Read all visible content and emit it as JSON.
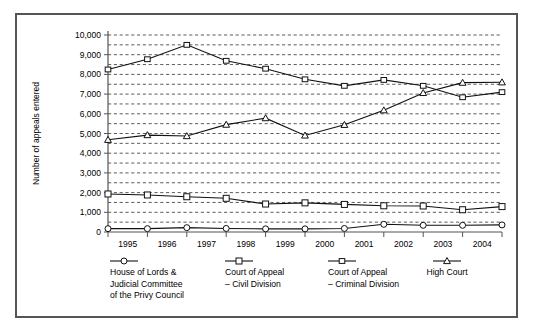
{
  "chart_data": {
    "type": "line",
    "title": "",
    "xlabel": "",
    "ylabel": "Number of appeals entered",
    "x": [
      "1995",
      "1996",
      "1997",
      "1998",
      "1999",
      "2000",
      "2001",
      "2002",
      "2003",
      "2004"
    ],
    "categories": [
      "1995",
      "1996",
      "1997",
      "1998",
      "1999",
      "2000",
      "2001",
      "2002",
      "2003",
      "2004"
    ],
    "ylim": [
      0,
      10000
    ],
    "ytick_labels": [
      "0",
      "1,000",
      "2,000",
      "3,000",
      "4,000",
      "5,000",
      "6,000",
      "7,000",
      "8,000",
      "9,000",
      "10,000"
    ],
    "ytick_values": [
      0,
      1000,
      2000,
      3000,
      4000,
      5000,
      6000,
      7000,
      8000,
      9000,
      10000
    ],
    "grid": true,
    "grid_style": "dashed-horizontal",
    "legend_position": "below",
    "series": [
      {
        "name": "House of Lords & Judicial Committee of the Privy Council",
        "marker": "circle",
        "values": [
          170,
          170,
          220,
          180,
          160,
          160,
          180,
          390,
          340,
          340
        ]
      },
      {
        "name": "Court of Appeal – Civil Division",
        "marker": "square",
        "values": [
          1930,
          1880,
          1790,
          1710,
          1420,
          1480,
          1400,
          1330,
          1320,
          1130
        ]
      },
      {
        "name": "Court of Appeal – Criminal Division",
        "marker": "small-square",
        "values": [
          8250,
          8770,
          9500,
          8690,
          8290,
          7750,
          7420,
          7720,
          7420,
          6840
        ]
      },
      {
        "name": "High Court",
        "marker": "triangle",
        "values": [
          4680,
          4920,
          4870,
          5450,
          5780,
          4900,
          5440,
          6180,
          7060,
          7580
        ]
      }
    ],
    "series_extra_point": {
      "note": "each series has an 11th plotted point at the right edge",
      "House of Lords & Judicial Committee of the Privy Council": 360,
      "Court of Appeal – Civil Division": 1290,
      "Court of Appeal – Criminal Division": 7100,
      "High Court": 7600
    }
  },
  "legend": {
    "items": [
      {
        "label_lines": [
          "House of Lords &",
          "Judicial Committee",
          "of the Privy Council"
        ],
        "marker": "circle"
      },
      {
        "label_lines": [
          "Court of Appeal",
          "– Civil Division"
        ],
        "marker": "square"
      },
      {
        "label_lines": [
          "Court of Appeal",
          "– Criminal Division"
        ],
        "marker": "small-square"
      },
      {
        "label_lines": [
          "High Court"
        ],
        "marker": "triangle"
      }
    ]
  },
  "axis": {
    "y_title": "Number of appeals entered"
  },
  "colors": {
    "line": "#111111",
    "marker_fill": "#ffffff",
    "grid": "#333333",
    "border": "#555555",
    "background": "#ffffff"
  }
}
